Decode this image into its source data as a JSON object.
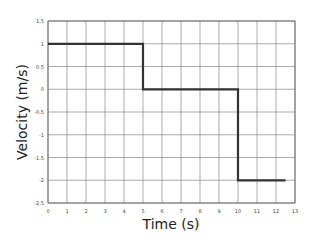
{
  "chart_data": {
    "type": "line",
    "title": "",
    "xlabel": "Time (s)",
    "ylabel": "Velocity (m/s)",
    "xlim": [
      0,
      13
    ],
    "ylim": [
      -2.5,
      1.5
    ],
    "grid": true,
    "legend": null,
    "x_ticks": [
      "0",
      "1",
      "2",
      "3",
      "4",
      "5",
      "6",
      "7",
      "8",
      "9",
      "10",
      "11",
      "12",
      "13"
    ],
    "y_ticks": [
      "1.5",
      "1",
      "0.5",
      "0",
      "-0.5",
      "-1",
      "-1.5",
      "-2",
      "-2.5"
    ],
    "series": [
      {
        "name": "velocity",
        "step": true,
        "x": [
          0,
          5,
          5,
          10,
          10,
          12.5
        ],
        "y": [
          1,
          1,
          0,
          0,
          -2,
          -2
        ]
      }
    ],
    "colors": {
      "line": "#333333",
      "grid": "#888888",
      "axis": "#666666"
    }
  }
}
